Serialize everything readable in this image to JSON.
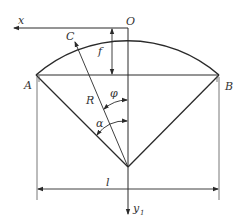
{
  "diagram": {
    "type": "arch-geometry",
    "labels": {
      "x_axis": "x",
      "origin": "O",
      "point_c": "C",
      "rise": "f",
      "left_support": "A",
      "right_support": "B",
      "radius": "R",
      "angle_phi": "φ",
      "angle_alpha": "α",
      "span": "l",
      "y_axis": "y",
      "y_axis_sub": "1"
    },
    "colors": {
      "line": "#2a2a2a",
      "thin": "#555555",
      "background": "#ffffff"
    }
  }
}
